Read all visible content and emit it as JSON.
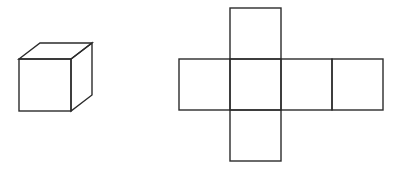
{
  "figure": {
    "stroke_color": "#2b2b2b",
    "background": "#ffffff",
    "cube": {
      "front_face": {
        "x": 19,
        "y": 59,
        "size": 52
      },
      "depth_offset": {
        "dx": 21,
        "dy": -16
      }
    },
    "net": {
      "square_size": 51,
      "squares": [
        {
          "name": "top",
          "x": 230,
          "y": 8
        },
        {
          "name": "left",
          "x": 179,
          "y": 59
        },
        {
          "name": "center",
          "x": 230,
          "y": 59
        },
        {
          "name": "right",
          "x": 281,
          "y": 59
        },
        {
          "name": "far-right",
          "x": 332,
          "y": 59
        },
        {
          "name": "bottom",
          "x": 230,
          "y": 110
        }
      ]
    }
  }
}
